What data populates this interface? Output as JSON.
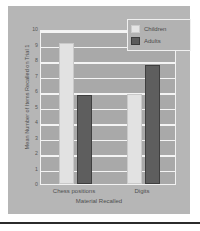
{
  "chart_data": {
    "type": "bar",
    "title": "",
    "categories": [
      "Chess positions",
      "Digits"
    ],
    "series": [
      {
        "name": "Children",
        "values": [
          9.1,
          5.8
        ],
        "color": "#e2e2e2"
      },
      {
        "name": "Adults",
        "values": [
          5.75,
          7.7
        ],
        "color": "#5e5e5e"
      }
    ],
    "xlabel": "Material Recalled",
    "ylabel": "Mean Number of Items Recalled on Trial 1",
    "ylim": [
      0,
      10
    ],
    "yticks": [
      0,
      1,
      2,
      3,
      4,
      5,
      6,
      7,
      8,
      9,
      10
    ],
    "ytick_labels": [
      "0",
      "1",
      "2",
      "3",
      "4",
      "5",
      "6",
      "7",
      "8",
      "9",
      "10"
    ],
    "grid": true,
    "legend_position": "top-right"
  },
  "legend": {
    "entries": [
      {
        "label": "Children",
        "swatch": "children-swatch"
      },
      {
        "label": "Adults",
        "swatch": "adults-swatch"
      }
    ]
  },
  "colors": {
    "figure_background": "#b6b6b6",
    "plot_background": "#a9a9a9",
    "gridline": "#f4f4f4",
    "children_bar": "#e2e2e2",
    "adults_bar": "#5e5e5e",
    "text": "#4f4f4f",
    "rule": "#2b2b2b"
  }
}
